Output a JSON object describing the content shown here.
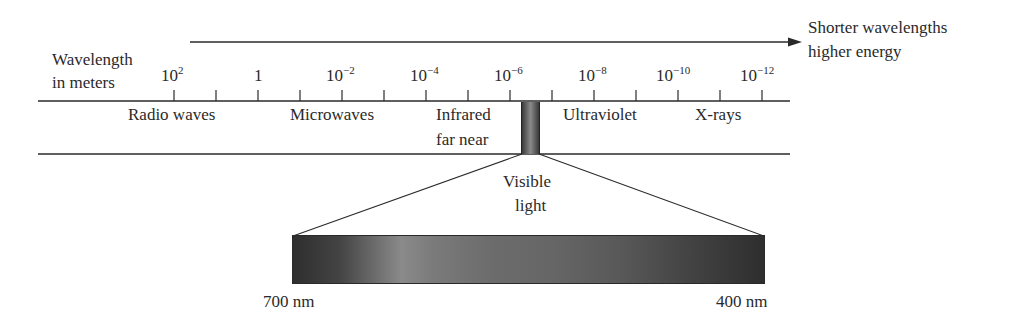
{
  "diagram": {
    "title_arrow_label_line1": "Shorter wavelengths",
    "title_arrow_label_line2": "higher energy",
    "axis_label_line1": "Wavelength",
    "axis_label_line2": "in meters",
    "ticks": [
      {
        "base": "10",
        "exp": "2"
      },
      {
        "base": "1",
        "exp": ""
      },
      {
        "base": "10",
        "exp": "−2"
      },
      {
        "base": "10",
        "exp": "−4"
      },
      {
        "base": "10",
        "exp": "−6"
      },
      {
        "base": "10",
        "exp": "−8"
      },
      {
        "base": "10",
        "exp": "−10"
      },
      {
        "base": "10",
        "exp": "−12"
      }
    ],
    "regions": {
      "radio": "Radio waves",
      "microwaves": "Microwaves",
      "infrared_line1": "Infrared",
      "infrared_line2": "far near",
      "ultraviolet": "Ultraviolet",
      "xrays": "X-rays"
    },
    "visible_label_line1": "Visible",
    "visible_label_line2": "light",
    "spectrum_left_label": "700 nm",
    "spectrum_right_label": "400 nm"
  },
  "colors": {
    "line": "#2a2a2a",
    "spectrum_dark": "#2e2e2e",
    "spectrum_light": "#8a8a8a"
  }
}
